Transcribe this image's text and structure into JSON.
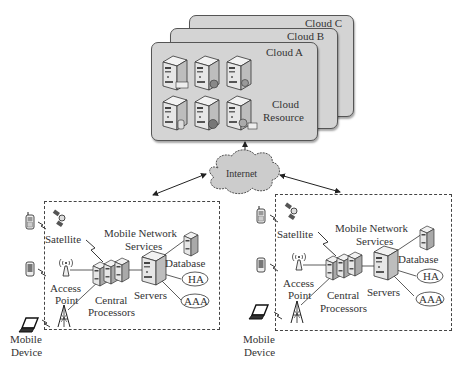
{
  "clouds": {
    "c": "Cloud C",
    "b": "Cloud B",
    "a": "Cloud A",
    "resource_line1": "Cloud",
    "resource_line2": "Resource"
  },
  "internet": "Internet",
  "networks": [
    {
      "satellite": "Satellite",
      "mns_line1": "Mobile Network",
      "mns_line2": "Services",
      "database": "Database",
      "access_line1": "Access",
      "access_line2": "Point",
      "central_line1": "Central",
      "central_line2": "Processors",
      "servers": "Servers",
      "ha": "HA",
      "aaa": "AAA",
      "device_line1": "Mobile",
      "device_line2": "Device"
    },
    {
      "satellite": "Satellite",
      "mns_line1": "Mobile Network",
      "mns_line2": "Services",
      "database": "Database",
      "access_line1": "Access",
      "access_line2": "Point",
      "central_line1": "Central",
      "central_line2": "Processors",
      "servers": "Servers",
      "ha": "HA",
      "aaa": "AAA",
      "device_line1": "Mobile",
      "device_line2": "Device"
    }
  ],
  "colors": {
    "panel_gray": "#d4d4d4",
    "cloud_gray": "#cccccc",
    "line": "#333333"
  }
}
